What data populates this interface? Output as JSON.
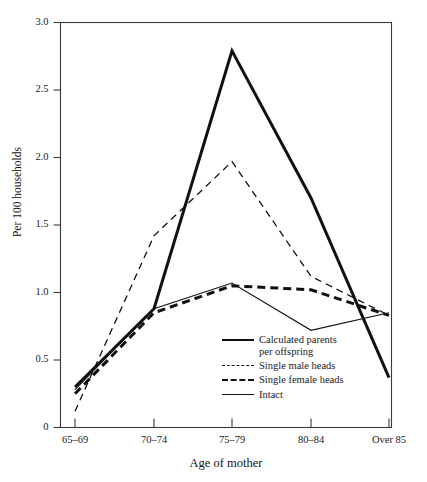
{
  "chart_data": {
    "type": "line",
    "title": "",
    "xlabel": "Age of mother",
    "ylabel": "Per 100 households",
    "categories": [
      "65–69",
      "70–74",
      "75–79",
      "80–84",
      "Over 85"
    ],
    "ylim": [
      0,
      3.0
    ],
    "yticks": [
      0,
      0.5,
      1.0,
      1.5,
      2.0,
      2.5,
      3.0
    ],
    "ytick_labels": [
      "0",
      "0.5",
      "1.0",
      "1.5",
      "2.0",
      "2.5",
      "3.0"
    ],
    "grid": false,
    "legend_position": "inside lower-right",
    "series": [
      {
        "name": "Calculated parents per offspring",
        "style": "thick-solid",
        "color": "#111111",
        "values": [
          0.3,
          0.88,
          2.79,
          1.7,
          0.37
        ]
      },
      {
        "name": "Single male heads",
        "style": "thin-dashed",
        "color": "#111111",
        "values": [
          0.12,
          1.42,
          1.97,
          1.12,
          0.83
        ]
      },
      {
        "name": "Single female heads",
        "style": "thick-dashed",
        "color": "#111111",
        "values": [
          0.25,
          0.85,
          1.05,
          1.02,
          0.83
        ]
      },
      {
        "name": "Intact",
        "style": "thin-solid",
        "color": "#111111",
        "values": [
          0.28,
          0.88,
          1.07,
          0.72,
          0.85
        ]
      }
    ]
  },
  "legend": {
    "items": [
      {
        "label": "Calculated parents\nper offspring",
        "style": "thick-solid"
      },
      {
        "label": "Single male heads",
        "style": "thin-dashed"
      },
      {
        "label": "Single female heads",
        "style": "thick-dashed"
      },
      {
        "label": "Intact",
        "style": "thin-solid"
      }
    ]
  },
  "axes": {
    "y_title": "Per 100 households",
    "x_title": "Age of mother"
  }
}
